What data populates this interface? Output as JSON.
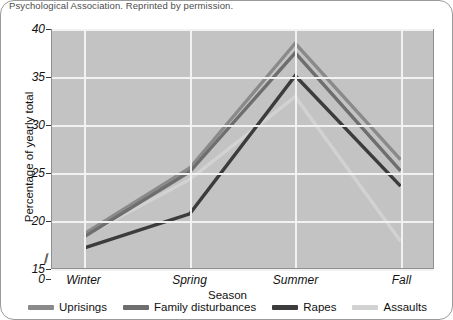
{
  "caption": "Psychological Association. Reprinted by permission.",
  "chart_data": {
    "type": "line",
    "title": "",
    "xlabel": "Season",
    "ylabel": "Percentage of yearly total",
    "categories": [
      "Winter",
      "Spring",
      "Summer",
      "Fall"
    ],
    "ylim": [
      15,
      40
    ],
    "yticks": [
      "0",
      "15",
      "20",
      "25",
      "30",
      "35",
      "40"
    ],
    "ytick_values": [
      0,
      15,
      20,
      25,
      30,
      35,
      40
    ],
    "axis_break": true,
    "grid": true,
    "legend_position": "bottom",
    "series": [
      {
        "name": "Uprisings",
        "color": "#8a8a8a",
        "values": [
          18.6,
          25.5,
          38.6,
          26.4
        ]
      },
      {
        "name": "Family disturbances",
        "color": "#6e6e6e",
        "values": [
          18.3,
          25.1,
          37.6,
          25.2
        ]
      },
      {
        "name": "Rapes",
        "color": "#3c3c3c",
        "values": [
          17.1,
          20.7,
          35.2,
          23.6
        ]
      },
      {
        "name": "Assaults",
        "color": "#d2d2d2",
        "values": [
          18.4,
          24.3,
          33.0,
          17.8
        ]
      }
    ]
  }
}
